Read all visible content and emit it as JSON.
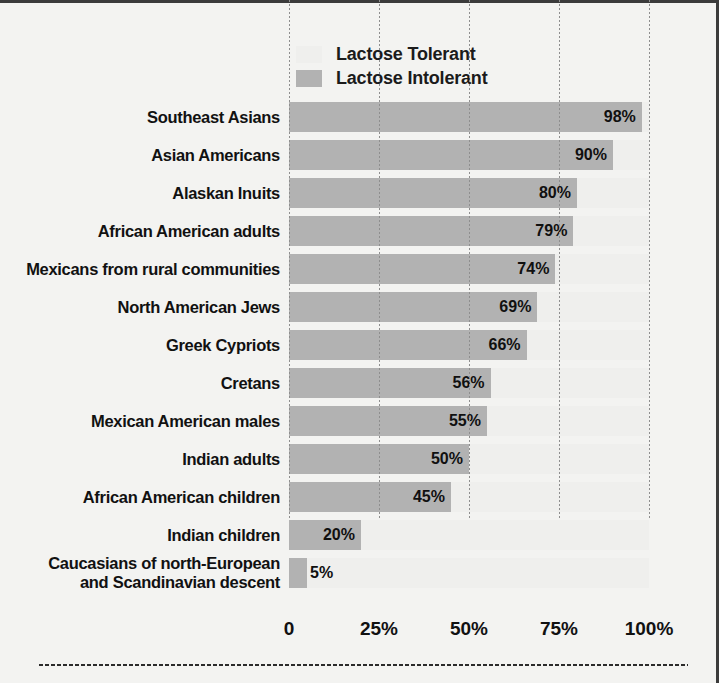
{
  "legend": {
    "items": [
      {
        "label": "Lactose Tolerant",
        "color": "#efefed"
      },
      {
        "label": "Lactose Intolerant",
        "color": "#b2b2b2"
      }
    ]
  },
  "axis": {
    "ticks": [
      "0",
      "25%",
      "50%",
      "75%",
      "100%"
    ],
    "tick_values": [
      0,
      25,
      50,
      75,
      100
    ]
  },
  "chart_data": {
    "type": "bar",
    "orientation": "horizontal",
    "stacked": true,
    "title": "",
    "xlabel": "",
    "ylabel": "",
    "xlim": [
      0,
      100
    ],
    "grid": true,
    "legend_position": "top",
    "categories": [
      "Southeast Asians",
      "Asian Americans",
      "Alaskan Inuits",
      "African American adults",
      "Mexicans from rural communities",
      "North American Jews",
      "Greek Cypriots",
      "Cretans",
      "Mexican American males",
      "Indian adults",
      "African American children",
      "Indian children",
      "Caucasians of north-European and Scandinavian descent"
    ],
    "category_lines": [
      [
        "Southeast Asians"
      ],
      [
        "Asian Americans"
      ],
      [
        "Alaskan Inuits"
      ],
      [
        "African American adults"
      ],
      [
        "Mexicans from rural communities"
      ],
      [
        "North American Jews"
      ],
      [
        "Greek Cypriots"
      ],
      [
        "Cretans"
      ],
      [
        "Mexican American males"
      ],
      [
        "Indian adults"
      ],
      [
        "African American children"
      ],
      [
        "Indian children"
      ],
      [
        "Caucasians of north-European",
        "and Scandinavian descent"
      ]
    ],
    "series": [
      {
        "name": "Lactose Intolerant",
        "color": "#b2b2b2",
        "values": [
          98,
          90,
          80,
          79,
          74,
          69,
          66,
          56,
          55,
          50,
          45,
          20,
          5
        ]
      },
      {
        "name": "Lactose Tolerant",
        "color": "#efefed",
        "values": [
          2,
          10,
          20,
          21,
          26,
          31,
          34,
          44,
          45,
          50,
          55,
          80,
          95
        ]
      }
    ],
    "data_labels": [
      "98%",
      "90%",
      "80%",
      "79%",
      "74%",
      "69%",
      "66%",
      "56%",
      "55%",
      "50%",
      "45%",
      "20%",
      "5%"
    ]
  }
}
